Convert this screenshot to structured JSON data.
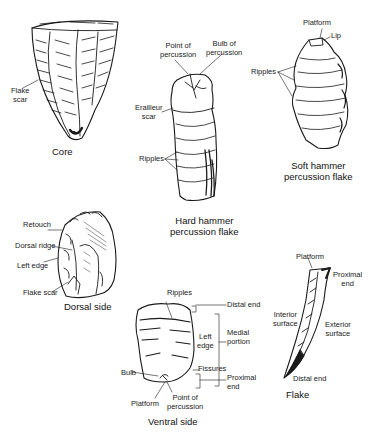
{
  "figures": [
    {
      "id": "core",
      "caption": "Core",
      "labels": [
        "Flake scar"
      ]
    },
    {
      "id": "hard-hammer",
      "caption_line1": "Hard hammer",
      "caption_line2": "percussion flake",
      "labels": [
        "Point of percussion",
        "Bulb of percussion",
        "Erailleur scar",
        "Ripples"
      ]
    },
    {
      "id": "soft-hammer",
      "caption_line1": "Soft hammer",
      "caption_line2": "percussion flake",
      "labels": [
        "Platform",
        "Lip",
        "Ripples"
      ]
    },
    {
      "id": "dorsal",
      "caption": "Dorsal side",
      "labels": [
        "Retouch",
        "Dorsal ridge",
        "Left edge",
        "Flake scar"
      ]
    },
    {
      "id": "ventral",
      "caption": "Ventral side",
      "labels": [
        "Ripples",
        "Distal end",
        "Left edge",
        "Medial portion",
        "Fissures",
        "Bulb",
        "Proximal end",
        "Platform",
        "Point of percussion"
      ]
    },
    {
      "id": "flake",
      "caption": "Flake",
      "labels": [
        "Platform",
        "Proximal end",
        "Interior surface",
        "Exterior surface",
        "Distal end"
      ]
    }
  ],
  "text": {
    "core_flake_scar_1": "Flake",
    "core_flake_scar_2": "scar",
    "core_caption": "Core",
    "hh_point_1": "Point of",
    "hh_point_2": "percussion",
    "hh_bulb_1": "Bulb of",
    "hh_bulb_2": "percussion",
    "hh_erailleur_1": "Erailleur",
    "hh_erailleur_2": "scar",
    "hh_ripples": "Ripples",
    "hh_caption_1": "Hard hammer",
    "hh_caption_2": "percussion flake",
    "sh_platform": "Platform",
    "sh_lip": "Lip",
    "sh_ripples": "Ripples",
    "sh_caption_1": "Soft hammer",
    "sh_caption_2": "percussion flake",
    "ds_retouch": "Retouch",
    "ds_ridge": "Dorsal ridge",
    "ds_left_edge": "Left edge",
    "ds_flake_scar": "Flake scar",
    "ds_caption": "Dorsal side",
    "vs_ripples": "Ripples",
    "vs_distal": "Distal end",
    "vs_left_1": "Left",
    "vs_left_2": "edge",
    "vs_medial_1": "Medial",
    "vs_medial_2": "portion",
    "vs_fissures": "Fissures",
    "vs_bulb": "Bulb",
    "vs_proximal_1": "Proximal",
    "vs_proximal_2": "end",
    "vs_platform": "Platform",
    "vs_point_1": "Point of",
    "vs_point_2": "percussion",
    "vs_caption": "Ventral side",
    "fl_platform": "Platform",
    "fl_proximal_1": "Proximal",
    "fl_proximal_2": "end",
    "fl_interior_1": "Interior",
    "fl_interior_2": "surface",
    "fl_exterior_1": "Exterior",
    "fl_exterior_2": "surface",
    "fl_distal": "Distal end",
    "fl_caption": "Flake"
  }
}
